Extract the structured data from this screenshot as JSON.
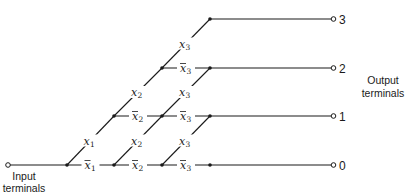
{
  "diagram": {
    "input_caption": [
      "Input",
      "terminals"
    ],
    "output_caption": [
      "Output",
      "terminals"
    ],
    "outputs": [
      "3",
      "2",
      "1",
      "0"
    ],
    "variables": [
      {
        "name": "x",
        "sub": "1"
      },
      {
        "name": "x",
        "sub": "2"
      },
      {
        "name": "x",
        "sub": "3"
      }
    ],
    "edges": [
      {
        "from": [
          0,
          0
        ],
        "to": [
          1,
          1
        ],
        "var": 0,
        "neg": false
      },
      {
        "from": [
          0,
          0
        ],
        "to": [
          1,
          0
        ],
        "var": 0,
        "neg": true
      },
      {
        "from": [
          1,
          1
        ],
        "to": [
          2,
          2
        ],
        "var": 1,
        "neg": false
      },
      {
        "from": [
          1,
          1
        ],
        "to": [
          2,
          1
        ],
        "var": 1,
        "neg": true
      },
      {
        "from": [
          1,
          0
        ],
        "to": [
          2,
          1
        ],
        "var": 1,
        "neg": false
      },
      {
        "from": [
          1,
          0
        ],
        "to": [
          2,
          0
        ],
        "var": 1,
        "neg": true
      },
      {
        "from": [
          2,
          2
        ],
        "to": [
          3,
          3
        ],
        "var": 2,
        "neg": false
      },
      {
        "from": [
          2,
          2
        ],
        "to": [
          3,
          2
        ],
        "var": 2,
        "neg": true
      },
      {
        "from": [
          2,
          1
        ],
        "to": [
          3,
          2
        ],
        "var": 2,
        "neg": false
      },
      {
        "from": [
          2,
          1
        ],
        "to": [
          3,
          1
        ],
        "var": 2,
        "neg": true
      },
      {
        "from": [
          2,
          0
        ],
        "to": [
          3,
          1
        ],
        "var": 2,
        "neg": false
      },
      {
        "from": [
          2,
          0
        ],
        "to": [
          3,
          0
        ],
        "var": 2,
        "neg": true
      }
    ]
  }
}
